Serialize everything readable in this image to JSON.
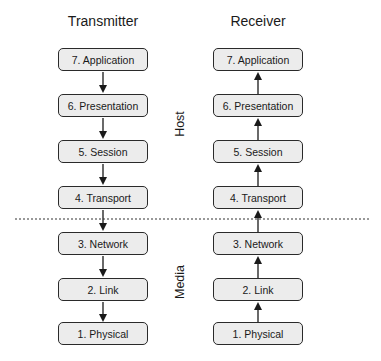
{
  "columns": [
    {
      "title": "Transmitter",
      "direction": "down",
      "layers": [
        "7. Application",
        "6. Presentation",
        "5. Session",
        "4. Transport",
        "3. Network",
        "2. Link",
        "1. Physical"
      ]
    },
    {
      "title": "Receiver",
      "direction": "up",
      "layers": [
        "7. Application",
        "6. Presentation",
        "5. Session",
        "4. Transport",
        "3. Network",
        "2. Link",
        "1. Physical"
      ]
    }
  ],
  "groups": {
    "upper": "Host",
    "lower": "Media"
  },
  "colors": {
    "box_fill": "#ececec",
    "box_border": "#2a2a2a",
    "arrow": "#1a1a1a",
    "divider": "#333333"
  }
}
